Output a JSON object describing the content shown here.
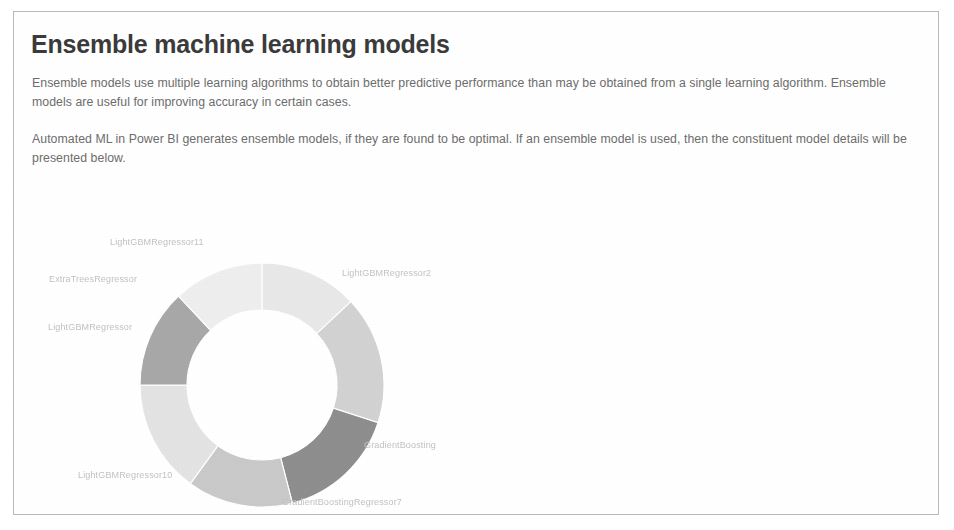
{
  "page": {
    "title": "Ensemble machine learning models",
    "paragraph_1": "Ensemble models use multiple learning algorithms to obtain better predictive performance than may be obtained from a single learning algorithm. Ensemble models are useful for improving accuracy in certain cases.",
    "paragraph_2": "Automated ML in Power BI generates ensemble models, if they are found to be optimal. If an ensemble model is used, then the constituent model details will be presented below."
  },
  "chart_data": {
    "type": "pie",
    "variant": "donut",
    "title": "",
    "xlabel": "",
    "ylabel": "",
    "legend_position": "none",
    "labels_outside": true,
    "categories": [
      "LightGBMRegressor11",
      "LightGBMRegressor2",
      "GradientBoosting",
      "GradientBoostingRegressor7",
      "LightGBMRegressor10",
      "LightGBMRegressor",
      "ExtraTreesRegressor"
    ],
    "values": [
      13,
      17,
      16,
      14,
      15,
      13,
      12
    ],
    "colors": [
      "#e8e8e8",
      "#d2d2d2",
      "#8e8e8e",
      "#c9c9c9",
      "#e3e3e3",
      "#a8a8a8",
      "#eeeeee"
    ],
    "slices": [
      {
        "label": "LightGBMRegressor11",
        "value": 13,
        "color": "#e8e8e8"
      },
      {
        "label": "LightGBMRegressor2",
        "value": 17,
        "color": "#d2d2d2"
      },
      {
        "label": "GradientBoosting",
        "value": 16,
        "color": "#8e8e8e"
      },
      {
        "label": "GradientBoostingRegressor7",
        "value": 14,
        "color": "#c9c9c9"
      },
      {
        "label": "LightGBMRegressor10",
        "value": 15,
        "color": "#e3e3e3"
      },
      {
        "label": "LightGBMRegressor",
        "value": 13,
        "color": "#a8a8a8"
      },
      {
        "label": "ExtraTreesRegressor",
        "value": 12,
        "color": "#eeeeee"
      }
    ],
    "geometry": {
      "center_x": 248,
      "center_y": 178,
      "outer_radius": 122,
      "inner_radius": 75,
      "start_angle_deg": -90
    },
    "label_positions": [
      {
        "label": "LightGBMRegressor11",
        "x": 96,
        "y": 30,
        "align": "left"
      },
      {
        "label": "LightGBMRegressor2",
        "x": 328,
        "y": 61,
        "align": "left"
      },
      {
        "label": "GradientBoosting",
        "x": 350,
        "y": 233,
        "align": "left"
      },
      {
        "label": "GradientBoostingRegressor7",
        "x": 268,
        "y": 290,
        "align": "left"
      },
      {
        "label": "LightGBMRegressor10",
        "x": 64,
        "y": 263,
        "align": "left"
      },
      {
        "label": "LightGBMRegressor",
        "x": 34,
        "y": 115,
        "align": "left"
      },
      {
        "label": "ExtraTreesRegressor",
        "x": 35,
        "y": 67,
        "align": "left"
      }
    ]
  }
}
